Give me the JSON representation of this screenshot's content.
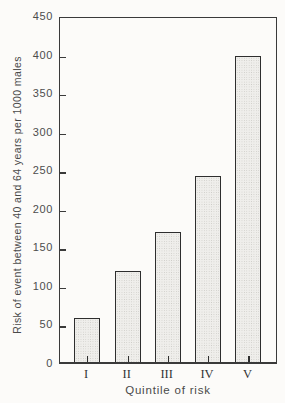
{
  "chart_data": {
    "type": "bar",
    "title": "",
    "xlabel": "Quintile of risk",
    "ylabel": "Risk of event between 40 and 64 years per 1000 males",
    "categories": [
      "I",
      "II",
      "III",
      "IV",
      "V"
    ],
    "values": [
      57,
      118,
      168,
      241,
      397
    ],
    "ylim": [
      0,
      450
    ],
    "yticks": [
      0,
      50,
      100,
      150,
      200,
      250,
      300,
      350,
      400,
      450
    ],
    "grid": false,
    "legend": "none",
    "colors": {
      "background": "#fcfbf9",
      "axis": "#3a3a3a",
      "bar_fill": "#efeeeb",
      "bar_stipple": "#cbcac5",
      "bar_border": "#2e2e2e",
      "text": "#4a4a4a"
    }
  }
}
